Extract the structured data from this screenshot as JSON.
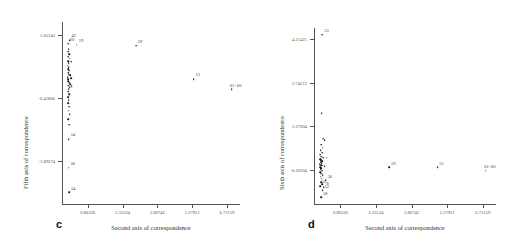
{
  "figure": {
    "panels": [
      {
        "letter": "c",
        "xlabel": "Second axis of correspondence",
        "ylabel": "Fifth axis of correspondence",
        "xticks": [
          "0.86326",
          "2.33534",
          "3.80742",
          "5.27951",
          "6.75159"
        ],
        "yticks": [
          "1.05342",
          "-0.41866",
          "-1.89074"
        ]
      },
      {
        "letter": "d",
        "xlabel": "Second axis of correspondence",
        "ylabel": "Sixth axis of correspondence",
        "xticks": [
          "0.86326",
          "2.33534",
          "3.80742",
          "5.27951",
          "6.75159"
        ],
        "yticks": [
          "4.21421",
          "2.74212",
          "1.27004",
          "-0.20204"
        ]
      }
    ]
  },
  "chart_data": [
    {
      "type": "scatter",
      "panel": "c",
      "title": "",
      "xlabel": "Second axis of correspondence",
      "ylabel": "Fifth axis of correspondence",
      "xlim": [
        -0.23,
        7.3
      ],
      "ylim": [
        -2.9,
        1.35
      ],
      "xticks": [
        0.86326,
        2.33534,
        3.80742,
        5.27951,
        6.75159
      ],
      "yticks": [
        1.05342,
        -0.41866,
        -1.89074
      ],
      "grid": false,
      "legend": false,
      "points": [
        {
          "x": 0.1,
          "y": 0.93,
          "label": "42"
        },
        {
          "x": 0.02,
          "y": 0.84,
          "label": "20"
        },
        {
          "x": 0.4,
          "y": 0.82,
          "label": "19"
        },
        {
          "x": 0.06,
          "y": 0.72,
          "label": ""
        },
        {
          "x": 0.04,
          "y": 0.66,
          "label": ""
        },
        {
          "x": 0.07,
          "y": 0.6,
          "label": ""
        },
        {
          "x": 0.03,
          "y": 0.54,
          "label": ""
        },
        {
          "x": 0.09,
          "y": 0.49,
          "label": ""
        },
        {
          "x": 0.02,
          "y": 0.44,
          "label": ""
        },
        {
          "x": 0.05,
          "y": 0.39,
          "label": ""
        },
        {
          "x": 0.17,
          "y": 0.42,
          "label": ""
        },
        {
          "x": 0.01,
          "y": 0.33,
          "label": ""
        },
        {
          "x": 0.06,
          "y": 0.29,
          "label": ""
        },
        {
          "x": 0.03,
          "y": 0.25,
          "label": ""
        },
        {
          "x": 0.08,
          "y": 0.21,
          "label": ""
        },
        {
          "x": 0.02,
          "y": 0.17,
          "label": ""
        },
        {
          "x": 0.05,
          "y": 0.13,
          "label": ""
        },
        {
          "x": 0.11,
          "y": 0.11,
          "label": ""
        },
        {
          "x": 0.01,
          "y": 0.06,
          "label": ""
        },
        {
          "x": 0.04,
          "y": 0.02,
          "label": ""
        },
        {
          "x": 0.15,
          "y": 0.04,
          "label": ""
        },
        {
          "x": 0.02,
          "y": -0.03,
          "label": ""
        },
        {
          "x": 0.07,
          "y": -0.07,
          "label": ""
        },
        {
          "x": 0.12,
          "y": -0.1,
          "label": ""
        },
        {
          "x": 0.03,
          "y": -0.14,
          "label": ""
        },
        {
          "x": 0.09,
          "y": -0.17,
          "label": ""
        },
        {
          "x": 0.18,
          "y": -0.15,
          "label": ""
        },
        {
          "x": 0.05,
          "y": -0.22,
          "label": ""
        },
        {
          "x": 0.02,
          "y": -0.28,
          "label": ""
        },
        {
          "x": 0.08,
          "y": -0.33,
          "label": ""
        },
        {
          "x": 0.04,
          "y": -0.4,
          "label": ""
        },
        {
          "x": 0.06,
          "y": -0.47,
          "label": ""
        },
        {
          "x": 0.03,
          "y": -0.55,
          "label": ""
        },
        {
          "x": 0.07,
          "y": -0.63,
          "label": ""
        },
        {
          "x": 0.05,
          "y": -0.72,
          "label": ""
        },
        {
          "x": 0.1,
          "y": -0.8,
          "label": ""
        },
        {
          "x": 0.04,
          "y": -0.92,
          "label": ""
        },
        {
          "x": 0.08,
          "y": -1.05,
          "label": ""
        },
        {
          "x": 0.06,
          "y": -1.38,
          "label": "14"
        },
        {
          "x": 0.05,
          "y": -2.05,
          "label": "58"
        },
        {
          "x": 0.07,
          "y": -2.62,
          "label": "54"
        },
        {
          "x": 2.9,
          "y": 0.8,
          "label": "59"
        },
        {
          "x": 5.35,
          "y": 0.02,
          "label": "51"
        },
        {
          "x": 6.95,
          "y": -0.22,
          "label": "61+60"
        }
      ]
    },
    {
      "type": "scatter",
      "panel": "d",
      "title": "",
      "xlabel": "Second axis of correspondence",
      "ylabel": "Sixth axis of correspondence",
      "xlim": [
        -0.23,
        7.3
      ],
      "ylim": [
        -1.35,
        4.6
      ],
      "xticks": [
        0.86326,
        2.33534,
        3.80742,
        5.27951,
        6.75159
      ],
      "yticks": [
        4.21421,
        2.74212,
        1.27004,
        -0.20204
      ],
      "grid": false,
      "legend": false,
      "points": [
        {
          "x": 0.12,
          "y": 4.38,
          "label": "53"
        },
        {
          "x": 0.09,
          "y": 1.72,
          "label": ""
        },
        {
          "x": 0.15,
          "y": 0.86,
          "label": ""
        },
        {
          "x": 0.22,
          "y": 0.8,
          "label": ""
        },
        {
          "x": 0.08,
          "y": 0.66,
          "label": ""
        },
        {
          "x": 0.13,
          "y": 0.55,
          "label": ""
        },
        {
          "x": 0.05,
          "y": 0.46,
          "label": ""
        },
        {
          "x": 0.1,
          "y": 0.38,
          "label": ""
        },
        {
          "x": 0.03,
          "y": 0.31,
          "label": ""
        },
        {
          "x": 0.07,
          "y": 0.25,
          "label": ""
        },
        {
          "x": 0.14,
          "y": 0.22,
          "label": ""
        },
        {
          "x": 0.02,
          "y": 0.17,
          "label": ""
        },
        {
          "x": 0.06,
          "y": 0.13,
          "label": ""
        },
        {
          "x": 0.11,
          "y": 0.1,
          "label": ""
        },
        {
          "x": 0.04,
          "y": 0.06,
          "label": ""
        },
        {
          "x": 0.09,
          "y": 0.03,
          "label": ""
        },
        {
          "x": 0.01,
          "y": -0.01,
          "label": ""
        },
        {
          "x": 0.06,
          "y": -0.04,
          "label": ""
        },
        {
          "x": 0.13,
          "y": -0.06,
          "label": ""
        },
        {
          "x": 0.03,
          "y": -0.1,
          "label": ""
        },
        {
          "x": 0.08,
          "y": -0.13,
          "label": ""
        },
        {
          "x": 0.29,
          "y": 0.22,
          "label": ""
        },
        {
          "x": 0.21,
          "y": -0.08,
          "label": ""
        },
        {
          "x": 0.05,
          "y": -0.18,
          "label": ""
        },
        {
          "x": 0.1,
          "y": -0.22,
          "label": ""
        },
        {
          "x": 0.02,
          "y": -0.27,
          "label": ""
        },
        {
          "x": 0.07,
          "y": -0.32,
          "label": ""
        },
        {
          "x": 0.13,
          "y": -0.37,
          "label": ""
        },
        {
          "x": 0.04,
          "y": -0.43,
          "label": ""
        },
        {
          "x": 0.09,
          "y": -0.49,
          "label": ""
        },
        {
          "x": 0.26,
          "y": -0.55,
          "label": "56"
        },
        {
          "x": 0.06,
          "y": -0.62,
          "label": ""
        },
        {
          "x": 0.11,
          "y": -0.68,
          "label": ""
        },
        {
          "x": 0.02,
          "y": -0.74,
          "label": "53"
        },
        {
          "x": 0.17,
          "y": -0.78,
          "label": "8"
        },
        {
          "x": 0.13,
          "y": -0.88,
          "label": "52"
        },
        {
          "x": 0.07,
          "y": -1.12,
          "label": "58"
        },
        {
          "x": 2.88,
          "y": -0.11,
          "label": "59"
        },
        {
          "x": 4.88,
          "y": -0.11,
          "label": "51"
        },
        {
          "x": 6.88,
          "y": -0.22,
          "label": "61+60"
        }
      ]
    }
  ]
}
